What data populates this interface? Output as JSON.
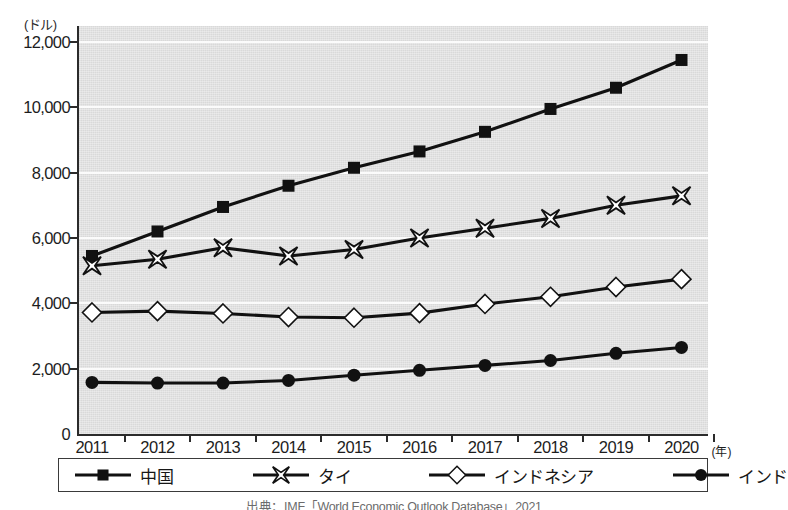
{
  "chart_data": {
    "type": "line",
    "title": "",
    "xlabel": "(年)",
    "ylabel": "(ドル)",
    "y_unit_label": "(ドル)",
    "x_unit_label": "(年)",
    "categories": [
      "2011",
      "2012",
      "2013",
      "2014",
      "2015",
      "2016",
      "2017",
      "2018",
      "2019",
      "2020"
    ],
    "ylim": [
      0,
      12000
    ],
    "ytick_step": 2000,
    "ytick_labels": [
      "12,000",
      "10,000",
      "8,000",
      "6,000",
      "4,000",
      "2,000",
      "0"
    ],
    "ytick_values": [
      12000,
      10000,
      8000,
      6000,
      4000,
      2000,
      0
    ],
    "grid": true,
    "legend_position": "bottom",
    "series": [
      {
        "name": "中国",
        "marker": "filled-square",
        "color": "#111111",
        "values": [
          5450,
          6200,
          6950,
          7600,
          8150,
          8650,
          9250,
          9950,
          10600,
          11450
        ]
      },
      {
        "name": "タイ",
        "marker": "x-cross",
        "color": "#111111",
        "values": [
          5150,
          5350,
          5700,
          5450,
          5650,
          6000,
          6300,
          6600,
          7000,
          7290
        ]
      },
      {
        "name": "インドネシア",
        "marker": "open-diamond",
        "color": "#111111",
        "values": [
          3720,
          3760,
          3690,
          3580,
          3560,
          3700,
          3980,
          4200,
          4500,
          4740
        ]
      },
      {
        "name": "インド",
        "marker": "filled-circle",
        "color": "#111111",
        "values": [
          1580,
          1560,
          1560,
          1640,
          1800,
          1950,
          2100,
          2250,
          2470,
          2650
        ]
      }
    ]
  },
  "legend": {
    "items": [
      {
        "label": "中国",
        "marker": "filled-square"
      },
      {
        "label": "タイ",
        "marker": "x-cross"
      },
      {
        "label": "インドネシア",
        "marker": "open-diamond"
      },
      {
        "label": "インド",
        "marker": "filled-circle"
      }
    ]
  },
  "source": {
    "text": "出典：IMF「World Economic Outlook Database」2021"
  },
  "colors": {
    "plot_background": "#d9d9d9",
    "gridline": "#fbfbfb",
    "axis": "#2b2b2b",
    "series": "#111111",
    "text": "#1d1d1d"
  }
}
